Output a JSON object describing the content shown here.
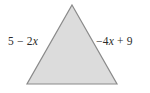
{
  "figure": {
    "type": "geometry-diagram",
    "shape_name": "triangle",
    "background_color": "#ffffff",
    "shape": {
      "fill_color": "#dcdcdc",
      "stroke_color": "#8a8a8a",
      "stroke_width": 1.2,
      "vertices": [
        {
          "name": "apex",
          "x": 72,
          "y": 5
        },
        {
          "name": "base-right",
          "x": 117,
          "y": 84
        },
        {
          "name": "base-left",
          "x": 27,
          "y": 84
        }
      ],
      "points_string": "72,5 117,84 27,84"
    },
    "labels": {
      "left_side": {
        "full_text": "5 − 2x",
        "parts": {
          "constant": "5 − 2",
          "variable": "x"
        },
        "expression": "5 - 2x",
        "color": "#2b2b2b"
      },
      "right_side": {
        "full_text": "−4x + 9",
        "parts": {
          "coefficient": "−4",
          "variable": "x",
          "tail": " + 9"
        },
        "expression": "-4x + 9",
        "color": "#2b2b2b"
      }
    }
  }
}
